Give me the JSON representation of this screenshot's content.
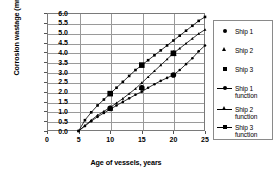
{
  "chart_data": {
    "type": "line",
    "title": "",
    "xlabel": "Age of vessels, years",
    "ylabel": "Corrosion wastage (mm)",
    "xlim": [
      0,
      25
    ],
    "ylim": [
      0.0,
      6.0
    ],
    "xticks": [
      "0",
      "5",
      "10",
      "15",
      "20",
      "25"
    ],
    "yticks": [
      "0.0",
      "0.5",
      "1.0",
      "1.5",
      "2.0",
      "2.5",
      "3.0",
      "3.5",
      "4.0",
      "4.5",
      "5.0",
      "5.5",
      "6.0"
    ],
    "grid": "horizontal-and-vertical",
    "legend_position": "right-outside",
    "series": [
      {
        "name": "Ship 1",
        "marker": "circle",
        "line": false,
        "x": [
          10,
          15,
          20
        ],
        "y": [
          1.15,
          2.2,
          2.85
        ]
      },
      {
        "name": "Ship 2",
        "marker": "triangle",
        "line": false,
        "x": [
          10,
          15,
          20
        ],
        "y": [
          1.15,
          2.2,
          3.95
        ]
      },
      {
        "name": "Ship 3",
        "marker": "square",
        "line": false,
        "x": [
          10,
          15,
          20
        ],
        "y": [
          1.9,
          3.35,
          3.95
        ]
      },
      {
        "name": "Ship 1 function",
        "marker": "circle",
        "line": true,
        "x": [
          5,
          6,
          7,
          8,
          9,
          10,
          11,
          12,
          13,
          14,
          15,
          16,
          17,
          18,
          19,
          20,
          21,
          22,
          23,
          24,
          25
        ],
        "y": [
          0.0,
          0.25,
          0.5,
          0.72,
          0.92,
          1.1,
          1.3,
          1.48,
          1.66,
          1.84,
          2.0,
          2.2,
          2.38,
          2.55,
          2.7,
          2.85,
          3.1,
          3.4,
          3.7,
          4.05,
          4.35
        ]
      },
      {
        "name": "Ship 2 function",
        "marker": "triangle",
        "line": true,
        "x": [
          5,
          6,
          7,
          8,
          9,
          10,
          11,
          12,
          13,
          14,
          15,
          16,
          17,
          18,
          19,
          20,
          21,
          22,
          23,
          24,
          25
        ],
        "y": [
          0.0,
          0.28,
          0.55,
          0.8,
          1.0,
          1.2,
          1.42,
          1.65,
          1.9,
          2.15,
          2.45,
          2.75,
          3.05,
          3.35,
          3.65,
          3.95,
          4.2,
          4.45,
          4.7,
          4.95,
          5.15
        ]
      },
      {
        "name": "Ship 3 function",
        "marker": "square",
        "line": true,
        "x": [
          5,
          6,
          7,
          8,
          9,
          10,
          11,
          12,
          13,
          14,
          15,
          16,
          17,
          18,
          19,
          20,
          21,
          22,
          23,
          24,
          25
        ],
        "y": [
          0.0,
          0.55,
          0.95,
          1.3,
          1.6,
          1.9,
          2.2,
          2.5,
          2.8,
          3.1,
          3.35,
          3.6,
          3.85,
          4.1,
          4.35,
          4.6,
          4.85,
          5.1,
          5.35,
          5.6,
          5.8
        ]
      }
    ],
    "legend_entries": [
      {
        "label": "Ship 1",
        "key": "circle-marker"
      },
      {
        "label": "Ship 2",
        "key": "triangle-marker"
      },
      {
        "label": "Ship 3",
        "key": "square-marker"
      },
      {
        "label": "Ship 1\nfunction",
        "key": "line-circle"
      },
      {
        "label": "Ship 2\nfunction",
        "key": "line-triangle"
      },
      {
        "label": "Ship 3\nfunction",
        "key": "line-square"
      }
    ],
    "colors": {
      "series": "#000000",
      "grid": "#9a9a9a",
      "frame": "#7a7a7a",
      "background": "#ffffff"
    }
  }
}
